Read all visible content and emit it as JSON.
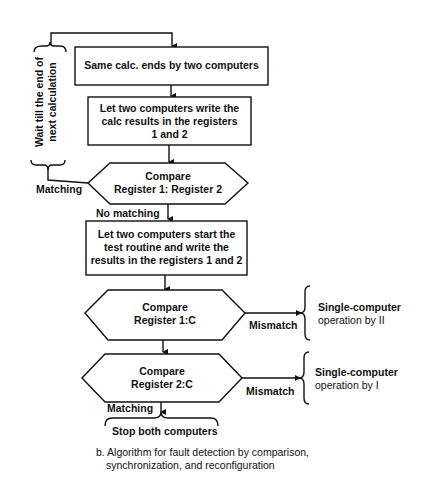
{
  "diagram": {
    "loop_label": "Wait till the end of next calculation",
    "loop_label_lines": [
      "Wait till the end of",
      "next calculation"
    ],
    "steps": [
      {
        "id": "box1",
        "type": "process",
        "text": "Same calc. ends by two computers"
      },
      {
        "id": "box2",
        "type": "process",
        "lines": [
          "Let two computers write the",
          "calc results in the registers",
          "1 and 2"
        ]
      },
      {
        "id": "dec1",
        "type": "decision",
        "lines": [
          "Compare",
          "Register 1:  Register 2"
        ]
      },
      {
        "id": "box3",
        "type": "process",
        "lines": [
          "Let two computers start the",
          "test routine and write the",
          "results in the registers 1 and 2"
        ]
      },
      {
        "id": "dec2",
        "type": "decision",
        "lines": [
          "Compare",
          "Register 1:C"
        ]
      },
      {
        "id": "dec3",
        "type": "decision",
        "lines": [
          "Compare",
          "Register 2:C"
        ]
      }
    ],
    "edge_labels": {
      "dec1_match": "Matching",
      "dec1_nomatch": "No matching",
      "dec2_mismatch": "Mismatch",
      "dec3_mismatch": "Mismatch",
      "dec3_match": "Matching"
    },
    "outcomes": {
      "dec2_result": [
        "Single-computer",
        "operation by II"
      ],
      "dec3_result": [
        "Single-computer",
        "operation by I"
      ],
      "stop": "Stop both computers"
    },
    "caption": [
      "b. Algorithm for fault detection by comparison,",
      "synchronization, and reconfiguration"
    ]
  }
}
